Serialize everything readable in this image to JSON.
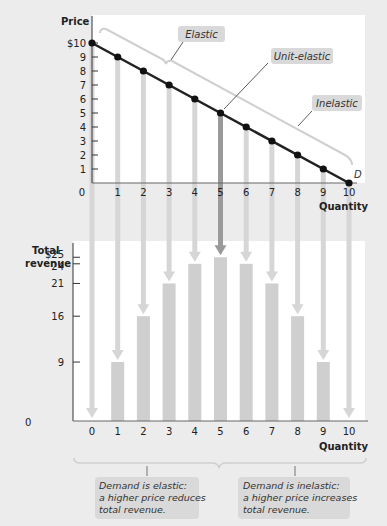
{
  "colors": {
    "background": "#ececec",
    "panel": "#ffffff",
    "demand_line": "#222222",
    "guide_bar": "#d6d6d6",
    "guide_bar_highlight": "#9a9a9a",
    "revenue_bar": "#cfcfcf",
    "callout_fill": "#d9d9d9",
    "bracket": "#d0d0d0"
  },
  "top_chart": {
    "ylabel": "Price",
    "xlabel": "Quantity",
    "curve_label": "D",
    "y_ticks": [
      "$10",
      "9",
      "8",
      "7",
      "6",
      "5",
      "4",
      "3",
      "2",
      "1"
    ],
    "x_ticks": [
      "0",
      "1",
      "2",
      "3",
      "4",
      "5",
      "6",
      "7",
      "8",
      "9",
      "10"
    ],
    "callouts": {
      "elastic": "Elastic",
      "unit_elastic": "Unit-elastic",
      "inelastic": "Inelastic"
    }
  },
  "bottom_chart": {
    "ylabel_line1": "Total",
    "ylabel_line2": "revenue",
    "xlabel": "Quantity",
    "y_origin": "0",
    "y_ticks": [
      "$25",
      "24",
      "21",
      "16",
      "9"
    ],
    "x_ticks": [
      "0",
      "1",
      "2",
      "3",
      "4",
      "5",
      "6",
      "7",
      "8",
      "9",
      "10"
    ]
  },
  "notes": {
    "elastic": [
      "Demand is elastic:",
      "a higher price reduces",
      "total revenue."
    ],
    "inelastic": [
      "Demand is inelastic:",
      "a higher price increases",
      "total revenue."
    ]
  },
  "chart_data": [
    {
      "type": "line",
      "title": "Demand curve",
      "xlabel": "Quantity",
      "ylabel": "Price",
      "x": [
        0,
        1,
        2,
        3,
        4,
        5,
        6,
        7,
        8,
        9,
        10
      ],
      "series": [
        {
          "name": "D",
          "values": [
            10,
            9,
            8,
            7,
            6,
            5,
            4,
            3,
            2,
            1,
            0
          ]
        }
      ],
      "xlim": [
        0,
        10
      ],
      "ylim": [
        0,
        10
      ],
      "annotations": [
        "Elastic",
        "Unit-elastic",
        "Inelastic"
      ],
      "grid": false
    },
    {
      "type": "bar",
      "title": "Total revenue",
      "xlabel": "Quantity",
      "ylabel": "Total revenue",
      "categories": [
        "0",
        "1",
        "2",
        "3",
        "4",
        "5",
        "6",
        "7",
        "8",
        "9",
        "10"
      ],
      "values": [
        0,
        9,
        16,
        21,
        24,
        25,
        24,
        21,
        16,
        9,
        0
      ],
      "ylim": [
        0,
        25
      ],
      "annotations": [
        "Demand is elastic: a higher price reduces total revenue.",
        "Demand is inelastic: a higher price increases total revenue."
      ],
      "grid": false
    }
  ]
}
